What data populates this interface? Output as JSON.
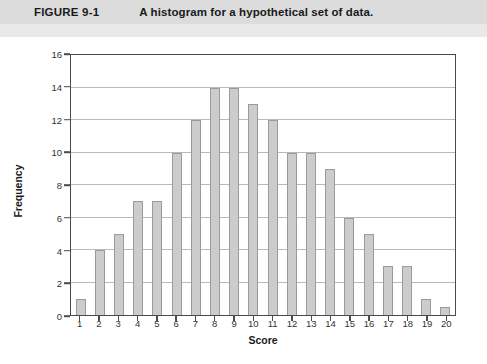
{
  "header": {
    "figure_number": "FIGURE 9-1",
    "caption": "A histogram for a hypothetical set of data.",
    "band_color": "#dcdcdc"
  },
  "chart_data": {
    "type": "bar",
    "title": "A histogram for a hypothetical set of data.",
    "xlabel": "Score",
    "ylabel": "Frequency",
    "categories": [
      "1",
      "2",
      "3",
      "4",
      "5",
      "6",
      "7",
      "8",
      "9",
      "10",
      "11",
      "12",
      "13",
      "14",
      "15",
      "16",
      "17",
      "18",
      "19",
      "20"
    ],
    "values": [
      1,
      4,
      5,
      7,
      7,
      10,
      12,
      14,
      14,
      13,
      12,
      10,
      10,
      9,
      6,
      5,
      3,
      3,
      1,
      0.5
    ],
    "ylim": [
      0,
      16
    ],
    "y_ticks": [
      0,
      2,
      4,
      6,
      8,
      10,
      12,
      14,
      16
    ],
    "grid": true,
    "legend": "none",
    "bar_color": "#cccccc",
    "bar_border_color": "#9a9a9a",
    "axis_color": "#4a4a4a",
    "gridline_color": "#b9b9b9"
  }
}
